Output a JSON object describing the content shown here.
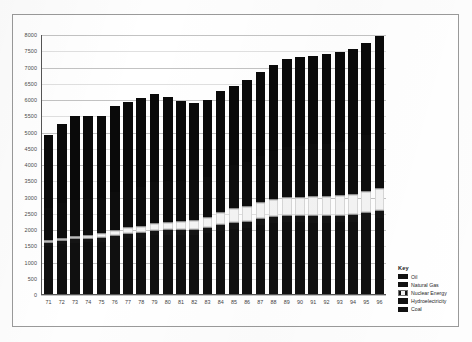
{
  "chart_data": {
    "type": "bar",
    "stacked": true,
    "title": "",
    "subtitle": "",
    "xlabel": "",
    "ylabel": "",
    "grid": true,
    "ylim": [
      0,
      8000
    ],
    "ytick_step": 500,
    "ytick_labels": [
      "8000",
      "7500",
      "7000",
      "6500",
      "6000",
      "5500",
      "5000",
      "4500",
      "4000",
      "3500",
      "3000",
      "2500",
      "2000",
      "1500",
      "1000",
      "500",
      "0"
    ],
    "categories": [
      "71",
      "72",
      "73",
      "74",
      "75",
      "76",
      "77",
      "78",
      "79",
      "80",
      "81",
      "82",
      "83",
      "84",
      "85",
      "86",
      "87",
      "88",
      "89",
      "90",
      "91",
      "92",
      "93",
      "94",
      "95",
      "96"
    ],
    "legend_title": "Key",
    "legend_position": "right",
    "series": [
      {
        "name": "Coal",
        "values": [
          1500,
          1560,
          1600,
          1610,
          1620,
          1700,
          1740,
          1760,
          1840,
          1850,
          1840,
          1840,
          1890,
          1980,
          2040,
          2070,
          2140,
          2200,
          2240,
          2230,
          2220,
          2210,
          2230,
          2250,
          2310,
          2360
        ]
      },
      {
        "name": "Hydroelectricity",
        "values": [
          100,
          105,
          105,
          115,
          120,
          120,
          125,
          135,
          140,
          145,
          150,
          155,
          165,
          170,
          175,
          180,
          185,
          190,
          190,
          195,
          200,
          205,
          210,
          215,
          225,
          230
        ]
      },
      {
        "name": "Nuclear Energy",
        "values": [
          25,
          35,
          50,
          70,
          100,
          120,
          150,
          170,
          180,
          200,
          240,
          260,
          300,
          360,
          420,
          440,
          470,
          500,
          520,
          540,
          560,
          570,
          590,
          600,
          620,
          640
        ]
      },
      {
        "name": "Natural Gas",
        "values": [
          1010,
          1070,
          1120,
          1120,
          1110,
          1170,
          1180,
          1210,
          1270,
          1260,
          1240,
          1230,
          1240,
          1310,
          1330,
          1360,
          1430,
          1490,
          1560,
          1590,
          1620,
          1630,
          1650,
          1670,
          1730,
          1800
        ]
      },
      {
        "name": "Oil",
        "values": [
          2285,
          2480,
          2625,
          2585,
          2550,
          2690,
          2725,
          2775,
          2760,
          2635,
          2500,
          2425,
          2395,
          2440,
          2450,
          2570,
          2625,
          2700,
          2740,
          2755,
          2760,
          2795,
          2790,
          2835,
          2875,
          2930
        ]
      }
    ],
    "series_totals": [
      4920,
      5250,
      5500,
      5500,
      5500,
      5800,
      5920,
      6050,
      6190,
      6090,
      5970,
      5910,
      5990,
      6260,
      6415,
      6620,
      6850,
      7080,
      7250,
      7310,
      7360,
      7410,
      7470,
      7570,
      7760,
      7960
    ]
  },
  "legend": {
    "title": "Key",
    "items": [
      {
        "label": "Oil",
        "swatch": "dark"
      },
      {
        "label": "Natural Gas",
        "swatch": "dark"
      },
      {
        "label": "Nuclear Energy",
        "swatch": "nuclear"
      },
      {
        "label": "Hydroelectricity",
        "swatch": "dark"
      },
      {
        "label": "Coal",
        "swatch": "dark"
      }
    ]
  },
  "colors": {
    "coal": "#101010",
    "hydroelectricity": "#141414",
    "nuclear_energy": "#f4f4f4",
    "natural_gas": "#0d0d0d",
    "oil": "#0a0a0a",
    "gridline": "#b9b9b9",
    "axis": "#555555",
    "frame": "#9a9a9a",
    "background": "#ffffff"
  }
}
